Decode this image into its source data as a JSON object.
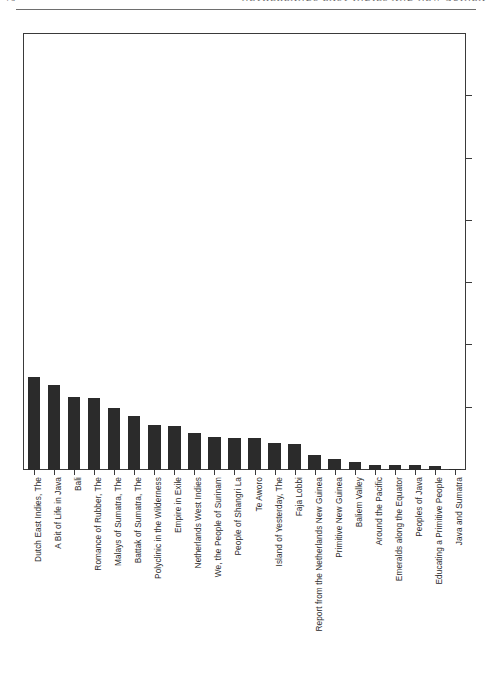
{
  "page": {
    "folio": "76",
    "running_title": "NETHERLANDS EAST INDIES AND NEW GUINEA",
    "header_rule": "horizontal-rule"
  },
  "figure": {
    "name": "bar-chart-film-titles",
    "bar_color": "#2b2b2b",
    "frame_color": "#3a3a3a",
    "background": "#ffffff",
    "right_axis_ticks": 6,
    "axis_tick_labels_visible": false
  },
  "chart_data": {
    "type": "bar",
    "title": "",
    "subtitle": "",
    "xlabel": "",
    "ylabel": "",
    "grid": false,
    "legend": false,
    "orientation": "vertical",
    "ylim": [
      0,
      420
    ],
    "categories": [
      "Dutch East Indies, The",
      "A Bit of Life in Java",
      "Bali",
      "Romance of Rubber, The",
      "Malays of Sumatra, The",
      "Battak of Sumatra, The",
      "Polyclinic in the Wilderness",
      "Empire in Exile",
      "Netherlands West Indies",
      "We, the People of Surinam",
      "People of Shangri La",
      "Te Aworo",
      "Island of Yesterday, The",
      "Faja Lobbi",
      "Report from the Netherlands New Guinea",
      "Primitive New Guinea",
      "Baliem Valley",
      "Around the Pacific",
      "Emeralds along the Equator",
      "Peoples of Java",
      "Educating a Primitive People",
      "Java and Sumatra"
    ],
    "values": [
      90,
      82,
      70,
      69,
      60,
      52,
      43,
      42,
      36,
      32,
      31,
      31,
      26,
      25,
      14,
      11,
      8,
      5,
      5,
      5,
      4,
      1
    ],
    "tick_labels": []
  }
}
